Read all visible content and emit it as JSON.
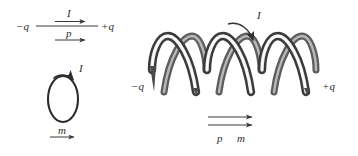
{
  "figure": {
    "background_color": "#ffffff",
    "ink_color": "#2b2b2b",
    "width": 358,
    "height": 156
  },
  "panels": {
    "electric_dipole": {
      "name": "electric dipole",
      "left_charge_label": "−q",
      "right_charge_label": "+q",
      "current_label": "I",
      "dipole_moment_label": "p"
    },
    "current_loop": {
      "name": "current loop",
      "current_label": "I",
      "magnetic_moment_label": "m"
    },
    "solenoid": {
      "name": "solenoid",
      "left_charge_label": "−q",
      "right_charge_label": "+q",
      "current_label": "I",
      "electric_moment_label": "p",
      "magnetic_moment_label": "m",
      "turns": 3
    }
  },
  "colors": {
    "coil_dark": "#4a4a4a",
    "coil_mid": "#8f8f8f",
    "coil_highlight": "#ffffff",
    "coil_edge": "#3a3a3a",
    "arrow": "#3a3a3a",
    "text": "#2b2b2b"
  }
}
